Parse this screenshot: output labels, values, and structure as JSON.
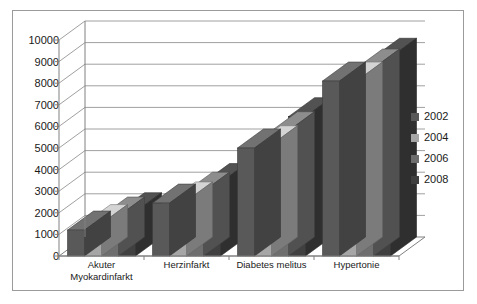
{
  "chart_data": {
    "type": "bar",
    "title": "",
    "subtitle": "",
    "xlabel": "",
    "ylabel": "",
    "categories": [
      "Akuter\nMyokardinfarkt",
      "Herzinfarkt",
      "Diabetes melitus",
      "Hypertonie"
    ],
    "series": [
      {
        "name": "2002",
        "color": "#595959",
        "values": [
          1200,
          2450,
          5000,
          8100
        ]
      },
      {
        "name": "2004",
        "color": "#a6a6a6",
        "values": [
          1500,
          2550,
          5150,
          8100
        ]
      },
      {
        "name": "2006",
        "color": "#6e6e6e",
        "values": [
          1850,
          3000,
          5800,
          8700
        ]
      },
      {
        "name": "2008",
        "color": "#404040",
        "values": [
          2050,
          3400,
          6450,
          9200
        ]
      }
    ],
    "ylim": [
      0,
      10000
    ],
    "ytick_values": [
      0,
      1000,
      2000,
      3000,
      4000,
      5000,
      6000,
      7000,
      8000,
      9000,
      10000
    ],
    "ytick_labels": [
      "0",
      "1000",
      "2000",
      "3000",
      "4000",
      "5000",
      "6000",
      "7000",
      "8000",
      "9000",
      "10000"
    ],
    "grid": true,
    "legend_position": "right",
    "legend_entries": [
      "2002",
      "2004",
      "2006",
      "2008"
    ],
    "style": "3d-clustered-column",
    "plot_background": "#ffffff",
    "axis_color": "#808080",
    "grid_color": "#a0a0a0",
    "border_color": "#9b9b9b"
  }
}
